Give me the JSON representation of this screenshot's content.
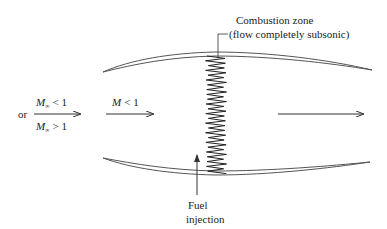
{
  "diagram": {
    "inlet": {
      "or_label": "or",
      "subsonic_label": "M",
      "subsonic_sub": "∞",
      "subsonic_rel": "< 1",
      "supersonic_label": "M",
      "supersonic_sub": "∞",
      "supersonic_rel": "> 1"
    },
    "internal_flow": {
      "label": "M",
      "rel": "< 1"
    },
    "combustion_zone": {
      "line1": "Combustion zone",
      "line2": "(flow completely subsonic)"
    },
    "fuel_injection": {
      "line1": "Fuel",
      "line2": "injection"
    }
  }
}
